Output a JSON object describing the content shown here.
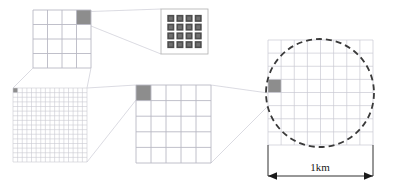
{
  "figure": {
    "type": "nested-zoom-schematic",
    "background_color": "#ffffff",
    "description_panels": 5
  },
  "colors": {
    "grid_line": "#b9b9c4",
    "grid_line_fine": "#c9c9d2",
    "panel_border": "#b9b9c4",
    "highlight_cell": "#8d8d8d",
    "dot_square": "#4d4d4d",
    "dot_square_inner": "#6f6f6f",
    "dot_panel_border": "#b0b0b0",
    "connector": "#d2d2da",
    "circle_dashed": "#3a3a3a",
    "dimension_line": "#1a1a1a",
    "label_text": "#1a1a1a"
  },
  "panels": {
    "coarse_grid_top_left": {
      "name": "4x4 grid with highlighted top-right cell",
      "x": 33,
      "y": 10,
      "width": 58,
      "height": 58,
      "cols": 4,
      "rows": 4,
      "highlight_col": 3,
      "highlight_row": 0
    },
    "dot_array_top_right": {
      "name": "4x4 dot array panel",
      "x": 161,
      "y": 9,
      "width": 47,
      "height": 45,
      "cols": 4,
      "rows": 4,
      "dot_size": 7
    },
    "fine_grid_bottom_left": {
      "name": "16x16 fine grid with highlighted top-left cell",
      "x": 13,
      "y": 88,
      "width": 74,
      "height": 74,
      "cols": 16,
      "rows": 16,
      "highlight_col": 0,
      "highlight_row": 0
    },
    "mid_grid_center": {
      "name": "5x5 grid with highlighted top-left cell",
      "x": 136,
      "y": 85,
      "width": 75,
      "height": 78,
      "cols": 5,
      "rows": 5,
      "highlight_col": 0,
      "highlight_row": 0
    },
    "circle_grid_right": {
      "name": "8x8 grid with dashed circle overlay",
      "x": 268,
      "y": 40,
      "width": 105,
      "height": 105,
      "cols": 8,
      "rows": 8,
      "highlight_col": 0,
      "highlight_row": 3,
      "circle_cx": 320,
      "circle_cy": 93,
      "circle_r": 54,
      "dash_pattern": "6 4"
    }
  },
  "connectors": [
    {
      "name": "topleft-cell-to-dotarray-upper",
      "x1": 77,
      "y1": 12,
      "x2": 161,
      "y2": 9
    },
    {
      "name": "topleft-cell-to-dotarray-lower",
      "x1": 91,
      "y1": 26,
      "x2": 161,
      "y2": 54
    },
    {
      "name": "finegrid-cell-to-topleft-upper",
      "x1": 13,
      "y1": 88,
      "x2": 33,
      "y2": 68
    },
    {
      "name": "finegrid-cell-to-topleft-lower",
      "x1": 87,
      "y1": 88,
      "x2": 91,
      "y2": 68
    },
    {
      "name": "midgrid-cell-to-finegrid-upper",
      "x1": 136,
      "y1": 85,
      "x2": 87,
      "y2": 88
    },
    {
      "name": "midgrid-cell-to-finegrid-lower",
      "x1": 136,
      "y1": 100,
      "x2": 87,
      "y2": 162
    },
    {
      "name": "circlegrid-cell-to-midgrid-upper",
      "x1": 268,
      "y1": 93,
      "x2": 211,
      "y2": 85
    },
    {
      "name": "circlegrid-cell-to-midgrid-lower",
      "x1": 268,
      "y1": 106,
      "x2": 211,
      "y2": 163
    }
  ],
  "dimension": {
    "label": "1km",
    "label_x": 320,
    "label_y": 171,
    "line_y": 176,
    "x_start": 268,
    "x_end": 373,
    "tick_top": 145,
    "arrow_size": 5
  }
}
